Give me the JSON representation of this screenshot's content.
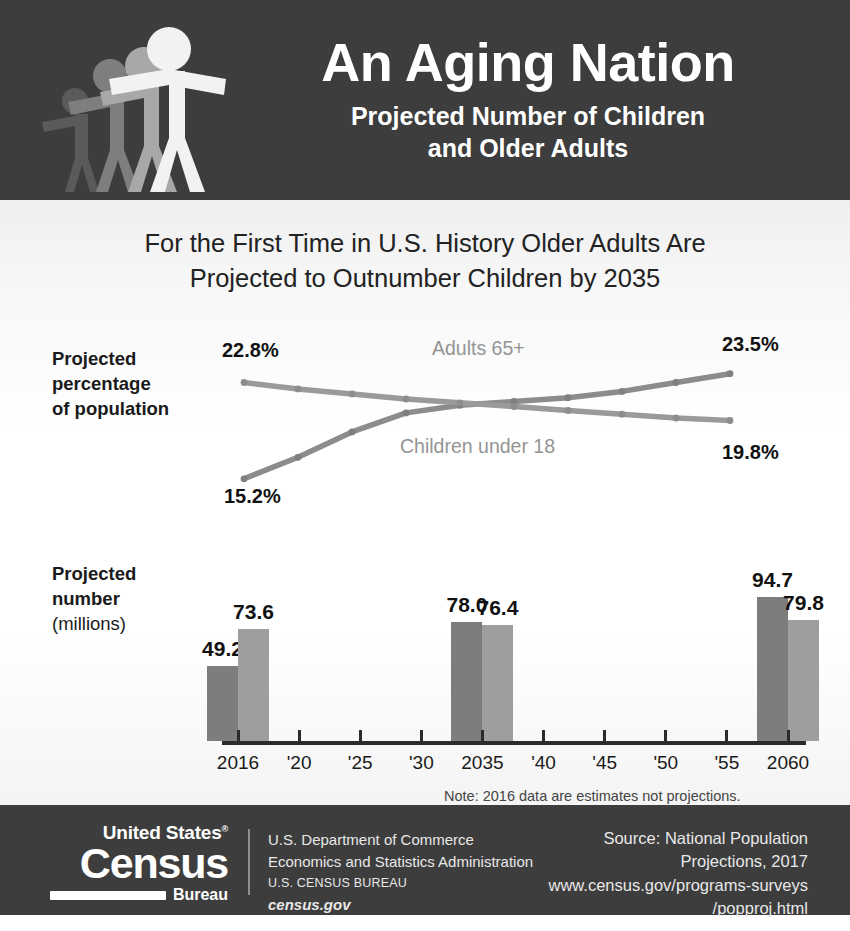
{
  "header": {
    "title": "An Aging Nation",
    "subtitle_line1": "Projected Number of Children",
    "subtitle_line2": "and Older Adults",
    "background_color": "#3d3d3d",
    "figure_colors": [
      "#5a5a5a",
      "#7e7e7e",
      "#a8a8a8",
      "#f2f2f2"
    ]
  },
  "headline": {
    "line1": "For the First Time in U.S. History Older Adults Are",
    "line2": "Projected to Outnumber Children by 2035"
  },
  "line_section": {
    "axis_label_bold": "Projected percentage",
    "axis_label_line3": "of population",
    "axis_label_l1": "Projected",
    "axis_label_l2": "percentage",
    "axis_label_l3": "of population"
  },
  "bars_section": {
    "axis_label_l1": "Projected",
    "axis_label_l2": "number",
    "axis_label_l3": "(millions)",
    "note": "Note: 2016 data are estimates not projections."
  },
  "footer": {
    "logo_united_states": "United States",
    "logo_registered": "®",
    "logo_census": "Census",
    "logo_bureau": "Bureau",
    "agency_line1": "U.S. Department of Commerce",
    "agency_line2": "Economics and Statistics Administration",
    "agency_line3": "U.S. CENSUS BUREAU",
    "agency_line4": "census.gov",
    "source_line1": "Source: National Population",
    "source_line2": "Projections, 2017",
    "source_line3": "www.census.gov/programs-surveys",
    "source_line4": "/popproj.html"
  },
  "chart_data": [
    {
      "type": "line",
      "title": "Projected percentage of population",
      "xlabel": "",
      "ylabel": "Projected percentage of population",
      "x": [
        2016,
        2020,
        2025,
        2030,
        2035,
        2040,
        2045,
        2050,
        2055,
        2060
      ],
      "ylim": [
        14.0,
        24.5
      ],
      "grid": false,
      "legend_position": "inline-labels",
      "series": [
        {
          "name": "Adults 65+",
          "color": "#8c8c8c",
          "values": [
            15.2,
            16.9,
            18.9,
            20.4,
            21.0,
            21.3,
            21.6,
            22.1,
            22.8,
            23.5
          ],
          "start_label": "15.2%",
          "end_label": "23.5%"
        },
        {
          "name": "Children under 18",
          "color": "#9a9a9a",
          "values": [
            22.8,
            22.3,
            21.9,
            21.5,
            21.2,
            20.9,
            20.6,
            20.3,
            20.0,
            19.8
          ],
          "start_label": "22.8%",
          "end_label": "19.8%"
        }
      ],
      "annotations": [
        {
          "text": "Adults 65+"
        },
        {
          "text": "Children under 18"
        }
      ]
    },
    {
      "type": "bar",
      "title": "Projected number (millions)",
      "xlabel": "",
      "ylabel": "Projected number (millions)",
      "categories": [
        "2016",
        "'20",
        "'25",
        "'30",
        "2035",
        "'40",
        "'45",
        "'50",
        "'55",
        "2060"
      ],
      "ylim": [
        0,
        100
      ],
      "grid": false,
      "series": [
        {
          "name": "Adults 65+",
          "color": "#7d7d7d",
          "labeled_categories": [
            "2016",
            "2035",
            "2060"
          ],
          "labeled_values": [
            49.2,
            78.0,
            94.7
          ]
        },
        {
          "name": "Children under 18",
          "color": "#9e9e9e",
          "labeled_categories": [
            "2016",
            "2035",
            "2060"
          ],
          "labeled_values": [
            73.6,
            76.4,
            79.8
          ]
        }
      ],
      "bars": [
        {
          "category": "2016",
          "series": "Adults 65+",
          "value": 49.2,
          "label": "49.2"
        },
        {
          "category": "2016",
          "series": "Children under 18",
          "value": 73.6,
          "label": "73.6"
        },
        {
          "category": "2035",
          "series": "Adults 65+",
          "value": 78.0,
          "label": "78.0"
        },
        {
          "category": "2035",
          "series": "Children under 18",
          "value": 76.4,
          "label": "76.4"
        },
        {
          "category": "2060",
          "series": "Adults 65+",
          "value": 94.7,
          "label": "94.7"
        },
        {
          "category": "2060",
          "series": "Children under 18",
          "value": 79.8,
          "label": "79.8"
        }
      ]
    }
  ]
}
